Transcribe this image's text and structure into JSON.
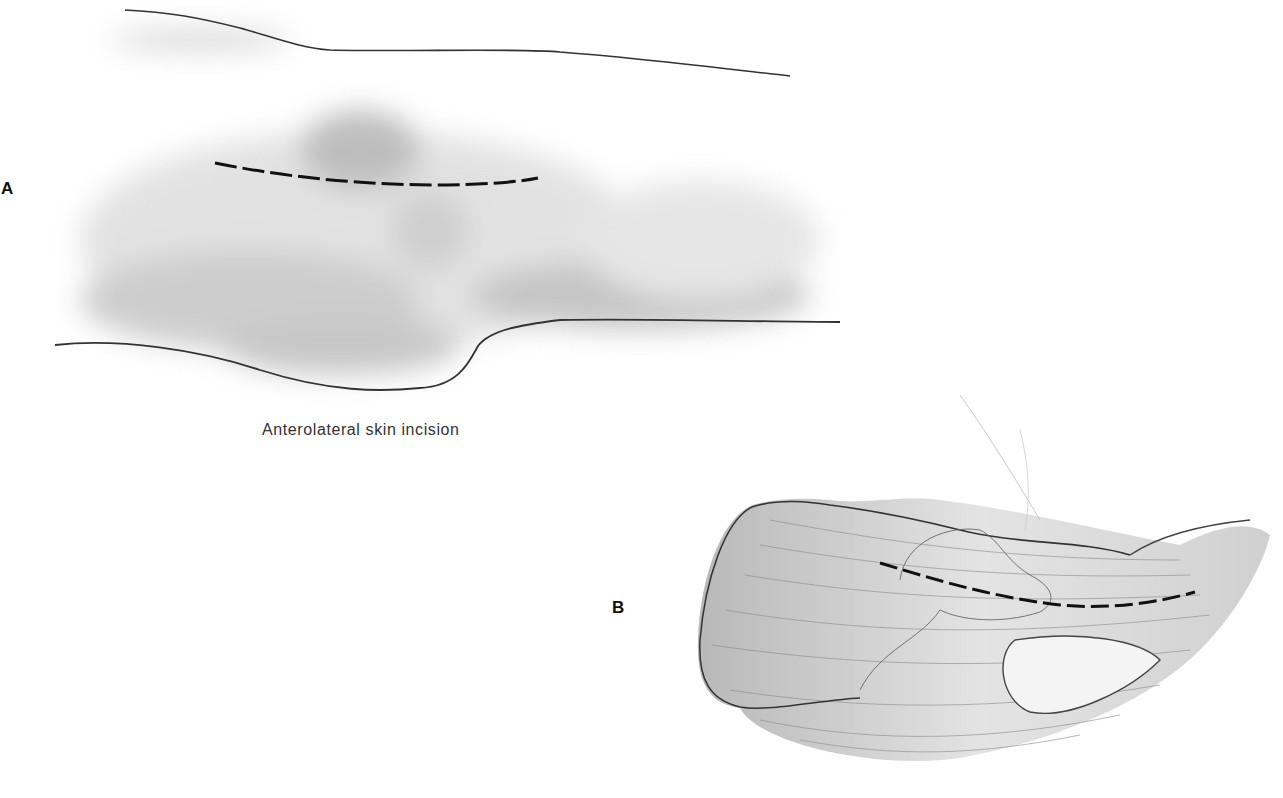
{
  "figure": {
    "panels": [
      {
        "id": "A",
        "label": "A",
        "caption": "Anterolateral skin incision",
        "description": "Skin surface view of limb with dashed anterolateral incision line"
      },
      {
        "id": "B",
        "label": "B",
        "caption": "",
        "description": "Deeper muscular layer view with dashed incision line along muscle fibers"
      }
    ],
    "colors": {
      "background": "#ffffff",
      "ink": "#111111",
      "shading": "#8a8a8a"
    }
  }
}
